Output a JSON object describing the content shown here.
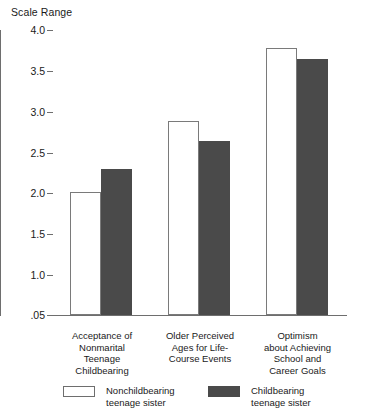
{
  "chart_data": {
    "type": "bar",
    "title": "",
    "ylabel": "Scale Range",
    "xlabel": "",
    "ylim": [
      0.05,
      4.0
    ],
    "grid": false,
    "legend_position": "bottom",
    "ytick_labels": [
      "4.0",
      "3.5",
      "3.0",
      "2.5",
      "2.0",
      "1.5",
      "1.0",
      ".05"
    ],
    "ytick_values": [
      4.0,
      3.5,
      3.0,
      2.5,
      2.0,
      1.5,
      1.0,
      0.05
    ],
    "categories": [
      "Acceptance of\nNonmarital\nTeenage\nChildbearing",
      "Older Perceived\nAges for Life-\nCourse Events",
      "Optimism\nabout Achieving\nSchool and\nCareer Goals"
    ],
    "category_lines": [
      [
        "Acceptance of",
        "Nonmarital",
        "Teenage",
        "Childbearing"
      ],
      [
        "Older Perceived",
        "Ages for Life-",
        "Course Events"
      ],
      [
        "Optimism",
        "about Achieving",
        "School and",
        "Career Goals"
      ]
    ],
    "series": [
      {
        "name": "Nonchildbearing teenage sister",
        "color": "#ffffff",
        "values": [
          1.76,
          2.7,
          3.68
        ]
      },
      {
        "name": "Childbearing teenage sister",
        "color": "#4a4a4a",
        "values": [
          2.04,
          2.45,
          3.55
        ]
      }
    ]
  },
  "axis": {
    "title": "Scale Range",
    "ticks": [
      {
        "label": "4.0",
        "top": 25
      },
      {
        "label": "3.5",
        "top": 66
      },
      {
        "label": "3.0",
        "top": 107
      },
      {
        "label": "2.5",
        "top": 148
      },
      {
        "label": "2.0",
        "top": 188
      },
      {
        "label": "1.5",
        "top": 229
      },
      {
        "label": "1.0",
        "top": 270
      },
      {
        "label": ".05",
        "top": 310
      }
    ]
  },
  "bars": [
    {
      "name": "acceptance-nonchildbearing",
      "left": 70,
      "top": 192,
      "width": 31,
      "height": 123,
      "style": "light"
    },
    {
      "name": "acceptance-childbearing",
      "left": 101,
      "top": 169,
      "width": 31,
      "height": 146,
      "style": "dark"
    },
    {
      "name": "older-ages-nonchildbearing",
      "left": 168,
      "top": 121,
      "width": 31,
      "height": 194,
      "style": "light"
    },
    {
      "name": "older-ages-childbearing",
      "left": 199,
      "top": 141,
      "width": 31,
      "height": 174,
      "style": "dark"
    },
    {
      "name": "optimism-nonchildbearing",
      "left": 266,
      "top": 48,
      "width": 31,
      "height": 267,
      "style": "light"
    },
    {
      "name": "optimism-childbearing",
      "left": 297,
      "top": 59,
      "width": 31,
      "height": 256,
      "style": "dark"
    }
  ],
  "category_labels": [
    {
      "left": 46,
      "width": 112,
      "lines": [
        "Acceptance of",
        "Nonmarital",
        "Teenage",
        "Childbearing"
      ]
    },
    {
      "left": 144,
      "width": 112,
      "lines": [
        "Older Perceived",
        "Ages for Life-",
        "Course Events"
      ]
    },
    {
      "left": 240,
      "width": 115,
      "lines": [
        "Optimism",
        "about Achieving",
        "School and",
        "Career Goals"
      ]
    }
  ],
  "legend": {
    "entries": [
      {
        "label_line1": "Nonchildbearing",
        "label_line2": "teenage sister",
        "style": "light"
      },
      {
        "label_line1": "Childbearing",
        "label_line2": "teenage sister",
        "style": "dark"
      }
    ]
  }
}
